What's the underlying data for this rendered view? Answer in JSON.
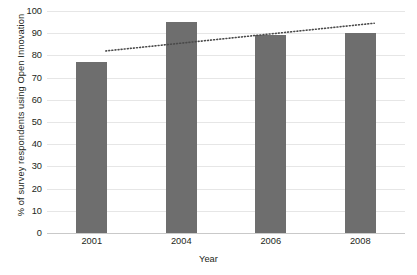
{
  "chart_data": {
    "type": "bar",
    "title": "",
    "subtitle": "",
    "xlabel": "Year",
    "ylabel": "% of survey respondents using Open Innovation",
    "categories": [
      "2001",
      "2004",
      "2006",
      "2008"
    ],
    "values": [
      77,
      95,
      89,
      90
    ],
    "ylim": [
      0,
      100
    ],
    "yticks": [
      0,
      10,
      20,
      30,
      40,
      50,
      60,
      70,
      80,
      90,
      100
    ],
    "ytick_labels": [
      "0",
      "10",
      "20",
      "30",
      "40",
      "50",
      "60",
      "70",
      "80",
      "90",
      "100"
    ],
    "grid": true,
    "legend": false,
    "legend_position": "none",
    "series": [
      {
        "name": "% of survey respondents using Open Innovation",
        "type": "bar",
        "values": [
          77,
          95,
          89,
          90
        ],
        "color": "#6e6e6e"
      },
      {
        "name": "trendline",
        "type": "line",
        "style": "dotted",
        "color": "#4a4a4a",
        "x": [
          "2001",
          "2008"
        ],
        "values": [
          82,
          94.5
        ]
      }
    ],
    "annotations": []
  },
  "axes": {
    "y_title": "% of survey respondents using Open Innovation",
    "x_title": "Year"
  },
  "colors": {
    "bar_fill": "#6e6e6e",
    "gridline": "#e6e6e6",
    "axis_line": "#c9c9c9",
    "trendline": "#4a4a4a",
    "text": "#231f20",
    "background": "#ffffff"
  }
}
